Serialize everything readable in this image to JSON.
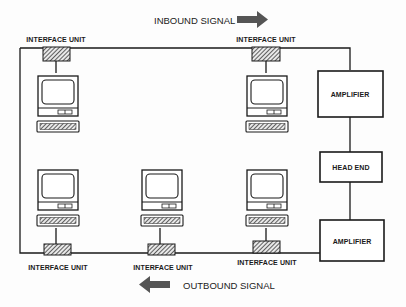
{
  "diagram": {
    "signals": {
      "inbound": "INBOUND SIGNAL",
      "outbound": "OUTBOUND SIGNAL"
    },
    "interface_unit_label": "INTERFACE UNIT",
    "blocks": {
      "amplifier_top": "AMPLIFIER",
      "head_end": "HEAD END",
      "amplifier_bottom": "AMPLIFIER"
    },
    "interface_units": [
      {
        "label": "INTERFACE UNIT",
        "position": "top-left"
      },
      {
        "label": "INTERFACE UNIT",
        "position": "top-right"
      },
      {
        "label": "INTERFACE UNIT",
        "position": "bottom-left"
      },
      {
        "label": "INTERFACE UNIT",
        "position": "bottom-middle"
      },
      {
        "label": "INTERFACE UNIT",
        "position": "bottom-right"
      }
    ],
    "colors": {
      "line": "#1a1a1a",
      "arrow": "#555555",
      "background": "#fdfdfd"
    }
  }
}
